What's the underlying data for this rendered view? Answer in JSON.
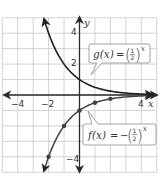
{
  "chart_data": {
    "type": "line",
    "title": "",
    "xlabel": "x",
    "ylabel": "y",
    "xlim": [
      -5,
      5
    ],
    "ylim": [
      -5,
      5
    ],
    "grid": true,
    "x_tick_labels": [
      "-4",
      "-2",
      "4"
    ],
    "y_tick_labels": [
      "4",
      "2",
      "-4"
    ],
    "series": [
      {
        "name": "g(x) = (1/2)^x",
        "function": "(1/2)^x",
        "x": [
          -2,
          -1,
          0,
          1,
          2,
          3,
          4
        ],
        "values": [
          4,
          2,
          1,
          0.5,
          0.25,
          0.125,
          0.0625
        ],
        "markers": false
      },
      {
        "name": "f(x) = -(1/2)^x",
        "function": "-(1/2)^x",
        "x": [
          -2,
          -1,
          0,
          1,
          2,
          3,
          4
        ],
        "values": [
          -4,
          -2,
          -1,
          -0.5,
          -0.25,
          -0.125,
          -0.0625
        ],
        "markers": true,
        "marked_points": [
          [
            -2,
            -4
          ],
          [
            -1,
            -2
          ],
          [
            0,
            -1
          ],
          [
            1,
            -0.5
          ],
          [
            2,
            -0.25
          ]
        ]
      }
    ],
    "annotations": [
      {
        "label": "g(x) = (1/2)^x",
        "position": "upper right",
        "points_to": "g"
      },
      {
        "label": "f(x) = -(1/2)^x",
        "position": "lower right",
        "points_to": "f"
      }
    ]
  },
  "labels": {
    "x_axis": "x",
    "y_axis": "y",
    "x_ticks": [
      {
        "value": -4,
        "text": "−4"
      },
      {
        "value": -2,
        "text": "−2"
      },
      {
        "value": 4,
        "text": "4"
      }
    ],
    "y_ticks": [
      {
        "value": 4,
        "text": "4"
      },
      {
        "value": 2,
        "text": "2"
      },
      {
        "value": -4,
        "text": "−4"
      }
    ],
    "g_callout": {
      "name": "g(x)",
      "eq": "=",
      "neg": "",
      "num": "1",
      "den": "2",
      "exp": "x"
    },
    "f_callout": {
      "name": "f(x)",
      "eq": "=",
      "neg": "−",
      "num": "1",
      "den": "2",
      "exp": "x"
    }
  },
  "colors": {
    "grid": "#c8c8c8",
    "axis": "#2a2a2a",
    "curve_g": "#1e1e1e",
    "curve_f": "#404040",
    "callout_border": "#9a9a9a"
  }
}
